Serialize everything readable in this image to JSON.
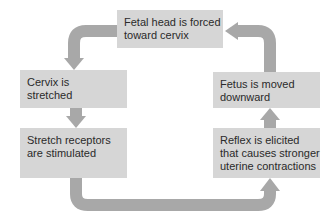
{
  "diagram": {
    "type": "positive-feedback-cycle",
    "nodes": [
      {
        "id": "fetal-head",
        "label": "Fetal head is forced toward cervix",
        "lines": [
          "Fetal head is forced",
          "toward cervix"
        ]
      },
      {
        "id": "cervix",
        "label": "Cervix is stretched",
        "lines": [
          "Cervix is",
          "stretched"
        ]
      },
      {
        "id": "receptors",
        "label": "Stretch receptors are stimulated",
        "lines": [
          "Stretch receptors",
          "are stimulated"
        ]
      },
      {
        "id": "reflex",
        "label": "Reflex is elicited that causes stronger uterine contractions",
        "lines": [
          "Reflex is elicited",
          "that causes stronger",
          "uterine contractions"
        ]
      },
      {
        "id": "fetus",
        "label": "Fetus is moved downward",
        "lines": [
          "Fetus is moved",
          "downward"
        ]
      }
    ],
    "edges": [
      {
        "from": "fetal-head",
        "to": "cervix"
      },
      {
        "from": "cervix",
        "to": "receptors"
      },
      {
        "from": "receptors",
        "to": "reflex"
      },
      {
        "from": "reflex",
        "to": "fetus"
      },
      {
        "from": "fetus",
        "to": "fetal-head"
      }
    ],
    "colors": {
      "box": "#d6d6d6",
      "arrow": "#a8a8a8",
      "text": "#2a2a2a"
    }
  }
}
